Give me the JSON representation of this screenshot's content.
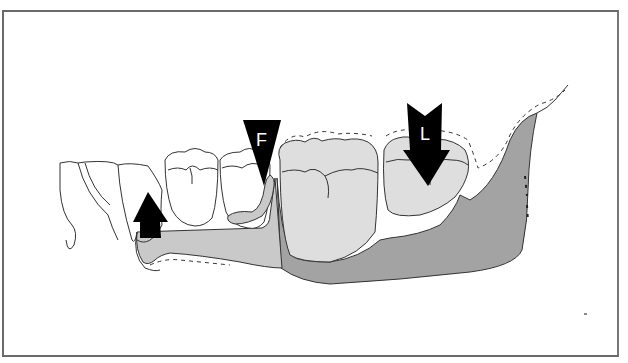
{
  "figure": {
    "labels": {
      "force_arrow_F": "F",
      "force_arrow_L": "L"
    },
    "colors": {
      "background": "#ffffff",
      "frame": "#6a6a6a",
      "outline": "#333333",
      "bone_dark": "#a3a3a3",
      "molar_fill": "#dedede",
      "connector_fill": "#c9c9c9",
      "arrow_fill": "#000000"
    },
    "elements": [
      {
        "name": "anterior-teeth",
        "type": "outline"
      },
      {
        "name": "premolar-1",
        "type": "outline"
      },
      {
        "name": "premolar-2",
        "type": "outline"
      },
      {
        "name": "clasp-arm",
        "type": "shaded"
      },
      {
        "name": "major-connector",
        "type": "shaded"
      },
      {
        "name": "molar-1",
        "type": "shaded"
      },
      {
        "name": "molar-2",
        "type": "shaded"
      },
      {
        "name": "mandible-body",
        "type": "shaded"
      },
      {
        "name": "soft-tissue-dashed-outline",
        "type": "dashed"
      },
      {
        "name": "up-arrow",
        "type": "arrow",
        "direction": "up"
      },
      {
        "name": "arrow-F",
        "type": "arrow",
        "direction": "down"
      },
      {
        "name": "arrow-L",
        "type": "arrow",
        "direction": "down"
      }
    ]
  }
}
